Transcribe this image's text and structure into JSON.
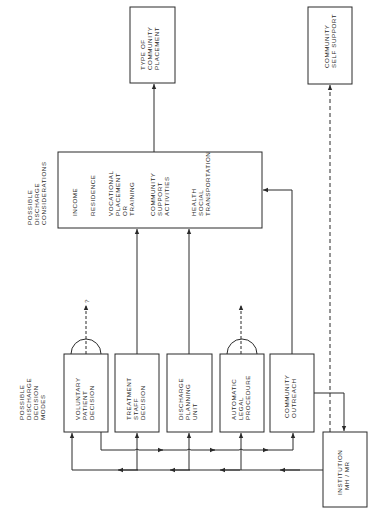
{
  "headings": {
    "considerations": [
      "POSSIBLE",
      "DISCHARGE",
      "CONSIDERATIONS"
    ],
    "modes": [
      "POSSIBLE",
      "DISCHARGE",
      "DECISION",
      "MODES"
    ]
  },
  "outcomes": {
    "type_of_community_placement": [
      "TYPE OF",
      "COMMUNITY",
      "PLACEMENT"
    ],
    "community_self_support": [
      "COMMUNITY",
      "SELF SUPPORT"
    ]
  },
  "considerations": {
    "items": [
      [
        "INCOME"
      ],
      [
        "RESIDENCE"
      ],
      [
        "VOCATIONAL",
        "PLACEMENT",
        "OR",
        "TRAINING"
      ],
      [
        "COMMUNITY",
        "SUPPORT",
        "ACTIVITIES"
      ],
      [
        "HEALTH",
        "SOCIAL",
        "TRANSPORTATION"
      ]
    ]
  },
  "modes": [
    {
      "id": "voluntary",
      "lines": [
        "VOLUNTARY",
        "PATIENT",
        "DECISION"
      ],
      "exit_label": "?"
    },
    {
      "id": "treatment",
      "lines": [
        "TREATMENT",
        "STAFF",
        "DECISION"
      ]
    },
    {
      "id": "discharge",
      "lines": [
        "DISCHARGE",
        "PLANNING",
        "UNIT"
      ]
    },
    {
      "id": "automatic",
      "lines": [
        "AUTOMATIC",
        "LEGAL",
        "PROCEDURE"
      ]
    },
    {
      "id": "outreach",
      "lines": [
        "COMMUNITY",
        "OUTREACH"
      ]
    }
  ],
  "institution": [
    "INSTITUTION",
    "MH / MR"
  ],
  "colors": {
    "ink": "#2a2a2a",
    "paper": "#ffffff"
  }
}
